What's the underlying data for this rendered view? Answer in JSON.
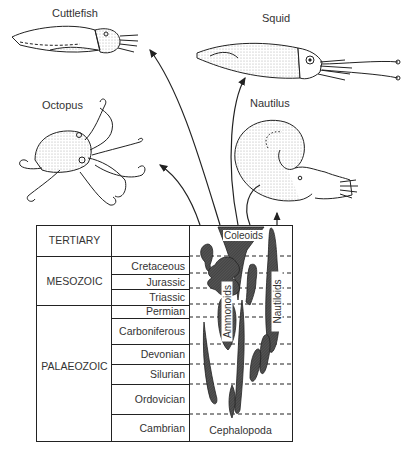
{
  "animals": {
    "cuttlefish": "Cuttlefish",
    "squid": "Squid",
    "octopus": "Octopus",
    "nautilus": "Nautilus"
  },
  "table": {
    "eras": [
      {
        "name": "TERTIARY"
      },
      {
        "name": "MESOZOIC"
      },
      {
        "name": "PALAEOZOIC"
      }
    ],
    "periods": [
      {
        "name": "Cretaceous",
        "era": "MESOZOIC"
      },
      {
        "name": "Jurassic",
        "era": "MESOZOIC"
      },
      {
        "name": "Triassic",
        "era": "MESOZOIC"
      },
      {
        "name": "Permian",
        "era": "PALAEOZOIC"
      },
      {
        "name": "Carboniferous",
        "era": "PALAEOZOIC"
      },
      {
        "name": "Devonian",
        "era": "PALAEOZOIC"
      },
      {
        "name": "Silurian",
        "era": "PALAEOZOIC"
      },
      {
        "name": "Ordovician",
        "era": "PALAEOZOIC"
      },
      {
        "name": "Cambrian",
        "era": "PALAEOZOIC"
      }
    ],
    "clades": {
      "coleoids": "Coleoids",
      "ammonoids": "Ammonoids",
      "nautiloids": "Nautiloids",
      "root": "Cephalopoda"
    }
  },
  "colors": {
    "ink": "#222222",
    "fill": "#4a4a4a",
    "stipple": "#bbbbbb"
  }
}
